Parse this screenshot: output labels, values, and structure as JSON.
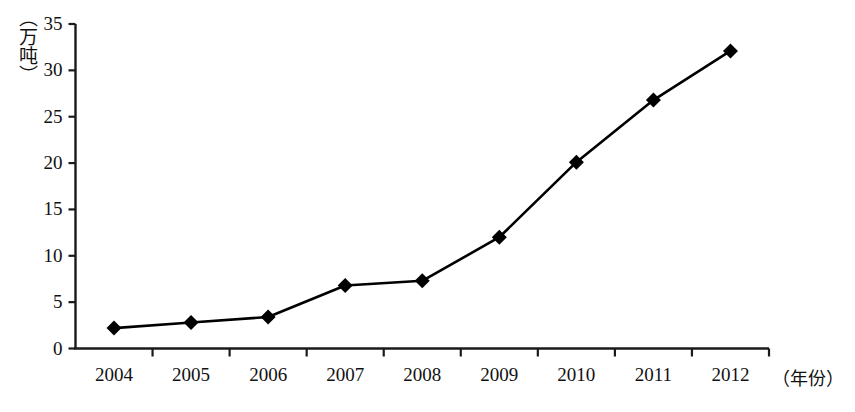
{
  "chart_data": {
    "type": "line",
    "title": "",
    "xlabel": "（年份）",
    "ylabel": "（万吨）",
    "categories": [
      "2004",
      "2005",
      "2006",
      "2007",
      "2008",
      "2009",
      "2010",
      "2011",
      "2012"
    ],
    "values": [
      2.2,
      2.8,
      3.4,
      6.8,
      7.3,
      12.0,
      20.1,
      26.8,
      32.1
    ],
    "series": [
      {
        "name": "产量",
        "values": [
          2.2,
          2.8,
          3.4,
          6.8,
          7.3,
          12.0,
          20.1,
          26.8,
          32.1
        ]
      }
    ],
    "ylim": [
      0,
      35
    ],
    "ytick_labels": [
      "0",
      "5",
      "10",
      "15",
      "20",
      "25",
      "30",
      "35"
    ],
    "ytick_values": [
      0,
      5,
      10,
      15,
      20,
      25,
      30,
      35
    ],
    "xtick_labels": [
      "2004",
      "2005",
      "2006",
      "2007",
      "2008",
      "2009",
      "2010",
      "2011",
      "2012"
    ],
    "grid": false,
    "legend": "none",
    "marker": "diamond",
    "line_color": "#000000",
    "marker_color": "#000000",
    "axis_color": "#1a1a1a",
    "background_color": "#ffffff"
  }
}
